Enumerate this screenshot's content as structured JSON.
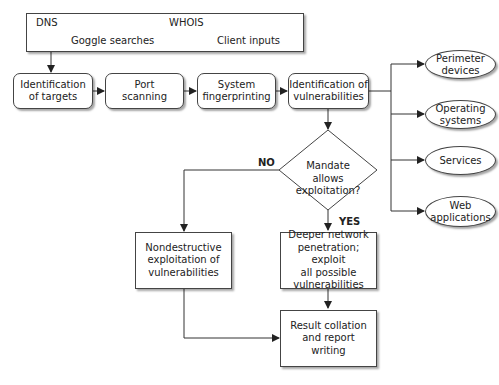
{
  "sources": {
    "items": [
      "DNS",
      "WHOIS",
      "Goggle searches",
      "Client inputs"
    ]
  },
  "process": {
    "identification_targets": "Identification\nof targets",
    "port_scanning": "Port\nscanning",
    "system_fingerprinting": "System\nfingerprinting",
    "identification_vulnerabilities": "Identification of\nvulnerabilities"
  },
  "targets": {
    "items": [
      "Perimeter\ndevices",
      "Operating\nsystems",
      "Services",
      "Web\napplications"
    ]
  },
  "decision": {
    "question": "Mandate\nallows\nexploitation?",
    "no_label": "NO",
    "yes_label": "YES"
  },
  "outcomes": {
    "nondestructive": "Nondestructive\nexploitation of\nvulnerabilities",
    "deeper": "Deeper network\npenetration; exploit\nall possible\nvulnerabilities",
    "result": "Result collation\nand report\nwriting"
  },
  "colors": {
    "line": "#333333",
    "border": "#444444",
    "background": "#ffffff"
  }
}
